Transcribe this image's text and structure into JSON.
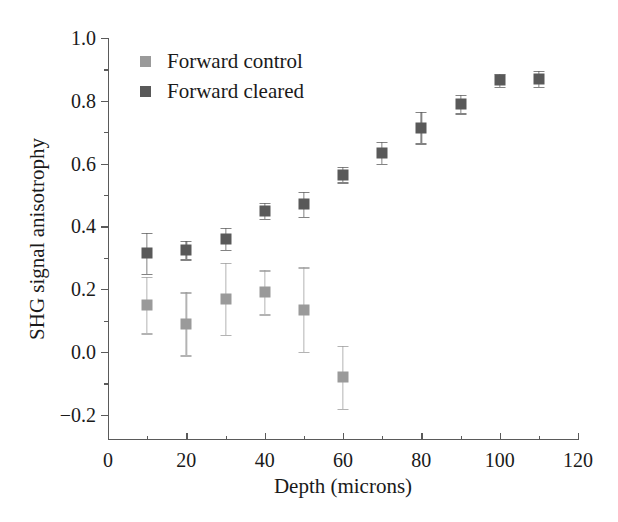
{
  "chart_data": {
    "type": "scatter",
    "title": "",
    "xlabel": "Depth (microns)",
    "ylabel": "SHG signal anisotrophy",
    "xlim": [
      0,
      120
    ],
    "ylim": [
      -0.28,
      1.0
    ],
    "xticks": [
      0,
      20,
      40,
      60,
      80,
      100,
      120
    ],
    "xtick_labels": [
      "0",
      "20",
      "40",
      "60",
      "80",
      "100",
      "120"
    ],
    "xminor_ticks": [
      10,
      30,
      50,
      70,
      90,
      110
    ],
    "yticks": [
      -0.2,
      0.0,
      0.2,
      0.4,
      0.6,
      0.8,
      1.0
    ],
    "ytick_labels": [
      "-0.2",
      "0.0",
      "0.2",
      "0.4",
      "0.6",
      "0.8",
      "1.0"
    ],
    "yminor_ticks": [
      -0.1,
      0.1,
      0.3,
      0.5,
      0.7,
      0.9
    ],
    "grid": false,
    "legend_position": "upper-left",
    "series": [
      {
        "name": "Forward control",
        "color": "#9a9a9a",
        "marker": "square",
        "x": [
          10,
          20,
          30,
          40,
          50,
          60
        ],
        "values": [
          0.15,
          0.09,
          0.17,
          0.19,
          0.135,
          -0.08
        ],
        "yerr_low": [
          0.09,
          0.1,
          0.115,
          0.07,
          0.135,
          0.1
        ],
        "yerr_high": [
          0.09,
          0.1,
          0.115,
          0.07,
          0.135,
          0.1
        ]
      },
      {
        "name": "Forward cleared",
        "color": "#595959",
        "marker": "square",
        "x": [
          10,
          20,
          30,
          40,
          50,
          60,
          70,
          80,
          90,
          100,
          110
        ],
        "values": [
          0.315,
          0.325,
          0.36,
          0.45,
          0.47,
          0.565,
          0.635,
          0.715,
          0.79,
          0.865,
          0.87
        ],
        "yerr_low": [
          0.065,
          0.03,
          0.035,
          0.025,
          0.04,
          0.025,
          0.035,
          0.05,
          0.03,
          0.02,
          0.025
        ],
        "yerr_high": [
          0.065,
          0.03,
          0.035,
          0.025,
          0.04,
          0.025,
          0.035,
          0.05,
          0.03,
          0.02,
          0.025
        ]
      }
    ]
  },
  "legend": {
    "entries": [
      {
        "label": "Forward control",
        "color": "#9a9a9a"
      },
      {
        "label": "Forward cleared",
        "color": "#595959"
      }
    ]
  },
  "axes": {
    "x_title": "Depth (microns)",
    "y_title": "SHG signal anisotrophy"
  }
}
